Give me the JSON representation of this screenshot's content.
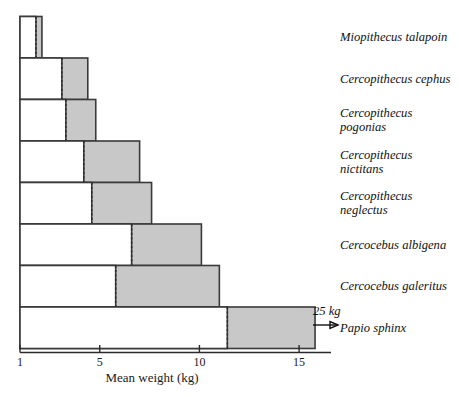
{
  "chart_data": {
    "type": "bar",
    "orientation": "horizontal",
    "title": "",
    "xlabel": "Mean weight (kg)",
    "ylabel": "",
    "xlim": [
      1,
      16.6
    ],
    "xticks": [
      1,
      5,
      10,
      15
    ],
    "xtick_labels": [
      "1",
      "5",
      "10",
      "15"
    ],
    "grid": false,
    "legend": null,
    "categories": [
      "Miopithecus talapoin",
      "Cercopithecus cephus",
      "Cercopithecus pogonias",
      "Cercopithecus nictitans",
      "Cercopithecus neglectus",
      "Cercocebus albigena",
      "Cercocebus galeritus",
      "Papio sphinx"
    ],
    "series": [
      {
        "name": "Female mean weight (kg)",
        "shade": "white",
        "values": [
          1.8,
          3.1,
          3.3,
          4.2,
          4.6,
          6.6,
          5.8,
          11.4
        ]
      },
      {
        "name": "Male mean weight (kg)",
        "shade": "gray",
        "values": [
          2.1,
          4.4,
          4.8,
          7.0,
          7.6,
          10.1,
          11.0,
          15.8
        ]
      }
    ],
    "annotations": [
      {
        "text": "25 kg",
        "attached_to": "Papio sphinx",
        "marker": "right-arrow",
        "meaning": "bar extends beyond axis to 25 kg"
      }
    ],
    "colors": {
      "gray_fill": "#c8c8c8",
      "white_fill": "#ffffff",
      "outline": "#3a3a3a",
      "axis": "#2b2b2b",
      "text": "#111111"
    }
  },
  "labels": {
    "species": [
      {
        "lines": [
          "Miopithecus talapoin"
        ]
      },
      {
        "lines": [
          "Cercopithecus cephus"
        ]
      },
      {
        "lines": [
          "Cercopithecus",
          "pogonias"
        ]
      },
      {
        "lines": [
          "Cercopithecus",
          "nictitans"
        ]
      },
      {
        "lines": [
          "Cercopithecus",
          "neglectus"
        ]
      },
      {
        "lines": [
          "Cercocebus albigena"
        ]
      },
      {
        "lines": [
          "Cercocebus galeritus"
        ]
      },
      {
        "lines": [
          "Papio sphinx"
        ]
      }
    ],
    "axis_title": "Mean weight (kg)",
    "ticks": [
      "1",
      "5",
      "10",
      "15"
    ],
    "annotation": "25 kg"
  }
}
